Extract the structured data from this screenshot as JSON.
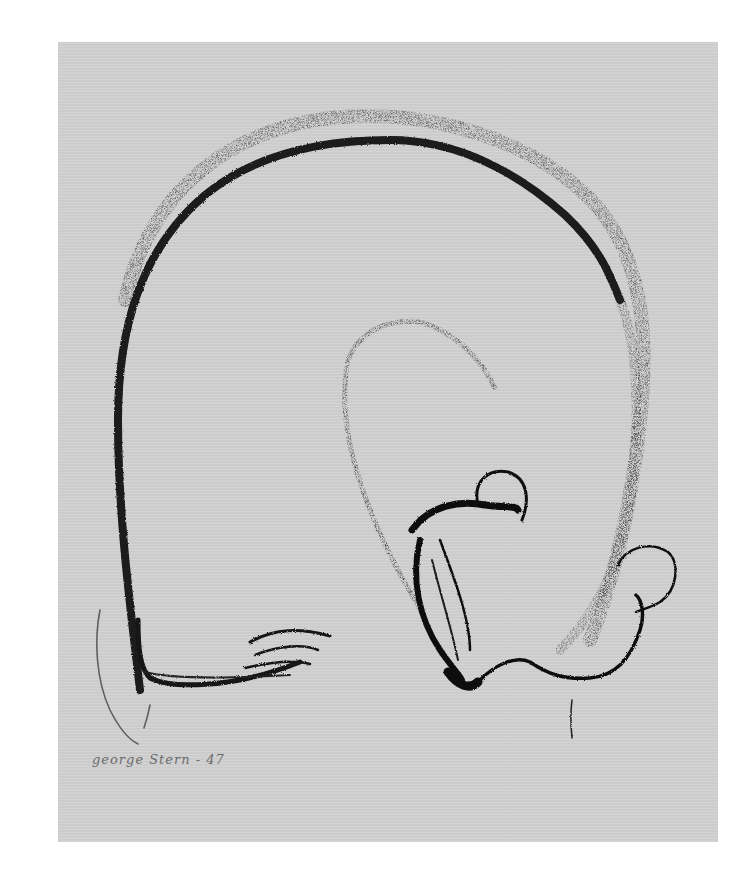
{
  "artwork": {
    "subject": "curled sleeping bear drawing",
    "medium_look": "black crayon on gray paper",
    "signature": "george Stern - 47",
    "colors": {
      "paper": "#cfcfcf",
      "background": "#ffffff",
      "ink": "#1a1a1a",
      "ink_light": "#3a3a3a",
      "signature": "#6a6a6a"
    }
  }
}
